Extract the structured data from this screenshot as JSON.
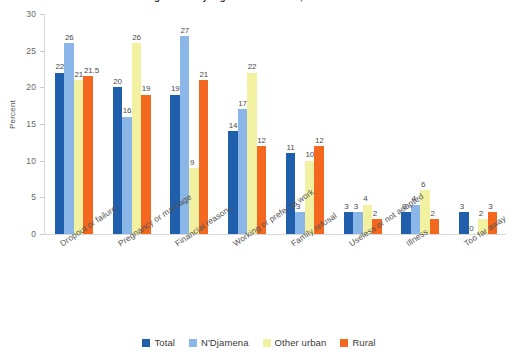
{
  "chart_data": {
    "type": "bar",
    "title": "Main reasons for not attending school by region of residence, Chad",
    "xlabel": "",
    "ylabel": "Percent",
    "ylim": [
      0,
      30
    ],
    "yticks": [
      0,
      5,
      10,
      15,
      20,
      25,
      30
    ],
    "grid": false,
    "legend_position": "bottom",
    "categories": [
      "Dropout or failure",
      "Pregnancy or marriage",
      "Financial reasons",
      "Working or prefer to work",
      "Family refusal",
      "Useless or not adapted",
      "Illness",
      "Too far away"
    ],
    "series": [
      {
        "name": "Total",
        "color": "#1f5fab",
        "values": [
          22,
          20,
          19,
          14,
          11,
          3,
          3,
          3
        ],
        "labels": [
          "22",
          "20",
          "19",
          "14",
          "11",
          "3",
          "3",
          "3"
        ]
      },
      {
        "name": "N'Djamena",
        "color": "#8ab6e8",
        "values": [
          26,
          16,
          27,
          17,
          3,
          3,
          4,
          0
        ],
        "labels": [
          "26",
          "16",
          "27",
          "17",
          "3",
          "3",
          "4",
          "0"
        ]
      },
      {
        "name": "Other urban",
        "color": "#f2f0a1",
        "values": [
          21,
          26,
          9,
          22,
          10,
          4,
          6,
          2
        ],
        "labels": [
          "21",
          "26",
          "9",
          "22",
          "10",
          "4",
          "6",
          "2"
        ]
      },
      {
        "name": "Rural",
        "color": "#f4671f",
        "values": [
          21.5,
          19,
          21,
          12,
          12,
          2,
          2,
          3
        ],
        "labels": [
          "21.5",
          "19",
          "21",
          "12",
          "12",
          "2",
          "2",
          "3"
        ]
      }
    ]
  }
}
